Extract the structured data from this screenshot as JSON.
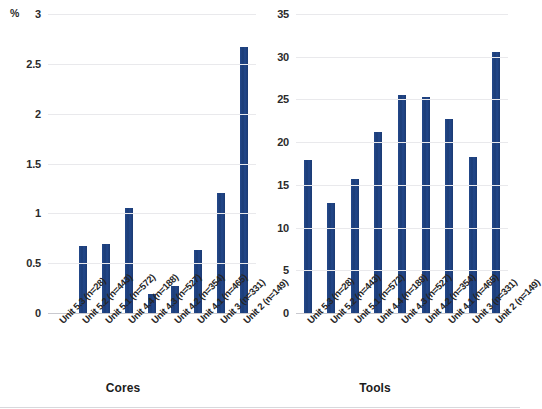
{
  "chart_data": [
    {
      "type": "bar",
      "title": "",
      "xlabel": "Cores",
      "ylabel": "%",
      "ylim": [
        0,
        3
      ],
      "yticks": [
        0,
        0.5,
        1,
        1.5,
        2,
        2.5,
        3
      ],
      "ytick_labels": [
        "0",
        "0.5",
        "1",
        "1.5",
        "2",
        "2.5",
        "3"
      ],
      "unit_label": "%",
      "grid": true,
      "legend": "none",
      "bar_color": "#1f4380",
      "categories": [
        "Unit 5.3 (n=28)",
        "Unit 5.2 (n=443)",
        "Unit 5.1 (n=572)",
        "Unit 4.4 (n=188)",
        "Unit 4.3 (n=527)",
        "Unit 4.2 (n=354)",
        "Unit 4.1 (n=465)",
        "Unit 3 (n=331)",
        "Unit 2 (n=149)"
      ],
      "values": [
        0,
        0.67,
        0.69,
        1.05,
        0.19,
        0.27,
        0.63,
        1.2,
        2.67
      ]
    },
    {
      "type": "bar",
      "title": "",
      "xlabel": "Tools",
      "ylabel": "",
      "ylim": [
        0,
        35
      ],
      "yticks": [
        0,
        5,
        10,
        15,
        20,
        25,
        30,
        35
      ],
      "ytick_labels": [
        "0",
        "5",
        "10",
        "15",
        "20",
        "25",
        "30",
        "35"
      ],
      "unit_label": "",
      "grid": true,
      "legend": "none",
      "bar_color": "#1f4380",
      "categories": [
        "Unit 5.3 (n=28)",
        "Unit 5.2 (n=443)",
        "Unit 5.1 (n=572)",
        "Unit 4.4 (n=188)",
        "Unit 4.3 (n=527)",
        "Unit 4.2 (n=354)",
        "Unit 4.1 (n=465)",
        "Unit 3 (n=331)",
        "Unit 2 (n=149)"
      ],
      "values": [
        17.9,
        12.9,
        15.7,
        21.2,
        25.5,
        25.3,
        22.7,
        18.3,
        30.6
      ]
    }
  ],
  "panels": {
    "left": {
      "axis_title": "Cores",
      "unit_label": "%"
    },
    "right": {
      "axis_title": "Tools",
      "unit_label": ""
    }
  }
}
